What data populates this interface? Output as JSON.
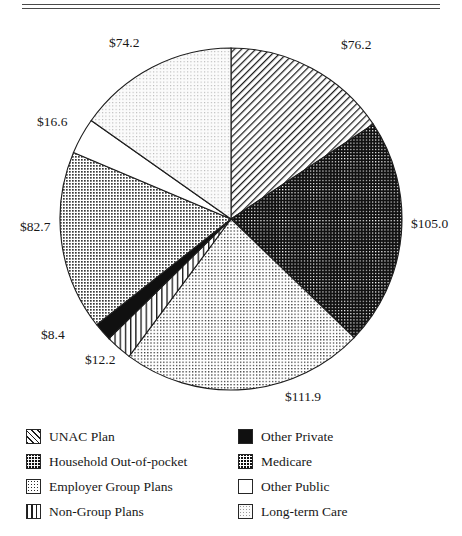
{
  "figure": {
    "top_rule_sliver": "",
    "background": "#ffffff",
    "ink": "#171717"
  },
  "chart_data": {
    "type": "pie",
    "title": "",
    "xlabel": "",
    "ylabel": "",
    "units": "billions of dollars",
    "total": 487.2,
    "start_angle_deg": 0,
    "direction": "clockwise",
    "legend_position": "bottom",
    "grid": false,
    "categories": [
      "UNAC Plan",
      "Medicare",
      "Household Out-of-pocket",
      "Non-Group Plans",
      "Other Private",
      "Employer Group Plans",
      "Other Public",
      "Long-term Care"
    ],
    "values": [
      76.2,
      105.0,
      111.9,
      12.2,
      8.4,
      82.7,
      16.6,
      74.2
    ],
    "labels": [
      "$76.2",
      "$105.0",
      "$111.9",
      "$12.2",
      "$8.4",
      "$82.7",
      "$16.6",
      "$74.2"
    ],
    "slices": [
      {
        "name": "UNAC Plan",
        "value": 76.2,
        "label": "$76.2",
        "pattern": "diagonal-hatch",
        "fill": "#ffffff",
        "stroke": "#1d1d1d"
      },
      {
        "name": "Medicare",
        "value": 105.0,
        "label": "$105.0",
        "pattern": "dense-crosshatch",
        "fill": "#111111",
        "stroke": "#1d1d1d"
      },
      {
        "name": "Household Out-of-pocket",
        "value": 111.9,
        "label": "$111.9",
        "pattern": "fine-dot",
        "fill": "#ffffff",
        "stroke": "#1d1d1d"
      },
      {
        "name": "Non-Group Plans",
        "value": 12.2,
        "label": "$12.2",
        "pattern": "vertical-lines",
        "fill": "#ffffff",
        "stroke": "#1d1d1d"
      },
      {
        "name": "Other Private",
        "value": 8.4,
        "label": "$8.4",
        "pattern": "solid-black",
        "fill": "#101010",
        "stroke": "#1d1d1d"
      },
      {
        "name": "Employer Group Plans",
        "value": 82.7,
        "label": "$82.7",
        "pattern": "medium-dot",
        "fill": "#ffffff",
        "stroke": "#1d1d1d"
      },
      {
        "name": "Other Public",
        "value": 16.6,
        "label": "$16.6",
        "pattern": "plain-white",
        "fill": "#ffffff",
        "stroke": "#1d1d1d"
      },
      {
        "name": "Long-term Care",
        "value": 74.2,
        "label": "$74.2",
        "pattern": "light-stipple",
        "fill": "#f7f7f7",
        "stroke": "#1d1d1d"
      }
    ]
  },
  "value_labels": [
    {
      "key": "unac",
      "text": "$76.2"
    },
    {
      "key": "medi",
      "text": "$105.0"
    },
    {
      "key": "hoop",
      "text": "$111.9"
    },
    {
      "key": "ngp",
      "text": "$12.2"
    },
    {
      "key": "oprv",
      "text": "$8.4"
    },
    {
      "key": "egp",
      "text": "$82.7"
    },
    {
      "key": "opub",
      "text": "$16.6"
    },
    {
      "key": "ltc",
      "text": "$74.2"
    }
  ],
  "legend": {
    "left_column": [
      {
        "label": "UNAC Plan",
        "pattern": "diagonal-hatch"
      },
      {
        "label": "Household Out-of-pocket",
        "pattern": "dense-dot-on-black"
      },
      {
        "label": "Employer Group Plans",
        "pattern": "light-dot"
      },
      {
        "label": "Non-Group Plans",
        "pattern": "vertical-lines"
      }
    ],
    "right_column": [
      {
        "label": "Other Private",
        "pattern": "solid-black"
      },
      {
        "label": "Medicare",
        "pattern": "crosshatch"
      },
      {
        "label": "Other Public",
        "pattern": "plain-white"
      },
      {
        "label": "Long-term Care",
        "pattern": "light-stipple"
      }
    ]
  }
}
